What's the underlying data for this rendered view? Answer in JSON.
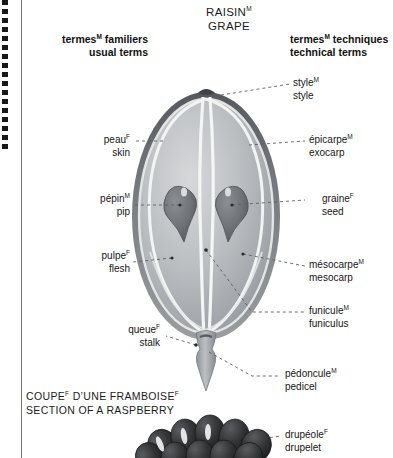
{
  "plate": {
    "title_fr": "RAISIN",
    "title_fr_sup": "M",
    "title_en": "GRAPE",
    "column_left_fr": "termes",
    "column_left_fr_sup": "M",
    "column_left_fr_rest": " familiers",
    "column_left_en": "usual terms",
    "column_right_fr": "termes",
    "column_right_fr_sup": "M",
    "column_right_fr_rest": " techniques",
    "column_right_en": "technical terms",
    "section_fr": "COUPE F D’UNE FRAMBOISE F",
    "section_fr_main": "COUPE",
    "section_fr_sup1": "F",
    "section_fr_mid": " D’UNE FRAMBOISE",
    "section_fr_sup2": "F",
    "section_en": "SECTION OF A RASPBERRY"
  },
  "labels_left": [
    {
      "fr": "peau",
      "sup": "F",
      "en": "skin"
    },
    {
      "fr": "pépin",
      "sup": "M",
      "en": "pip"
    },
    {
      "fr": "pulpe",
      "sup": "F",
      "en": "flesh"
    },
    {
      "fr": "queue",
      "sup": "F",
      "en": "stalk"
    }
  ],
  "labels_right": [
    {
      "fr": "style",
      "sup": "M",
      "en": "style"
    },
    {
      "fr": "épicarpe",
      "sup": "M",
      "en": "exocarp"
    },
    {
      "fr": "graine",
      "sup": "F",
      "en": "seed"
    },
    {
      "fr": "mésocarpe",
      "sup": "M",
      "en": "mesocarp"
    },
    {
      "fr": "funicule",
      "sup": "M",
      "en": "funiculus"
    },
    {
      "fr": "pédoncule",
      "sup": "M",
      "en": "pedicel"
    },
    {
      "fr": "drupéole",
      "sup": "F",
      "en": "drupelet"
    }
  ],
  "colors": {
    "background": "#ffffff",
    "text": "#161616",
    "leader_line": "#5b5f66",
    "skin_dark": "#6f7277",
    "flesh_light": "#c9cbcd",
    "flesh_mid": "#a8abae",
    "vascular": "#f0f1f2",
    "seed": "#74777b",
    "raspberry_dark": "#2b2c2e",
    "rule": "#6f7276",
    "binding": "#16171a"
  }
}
